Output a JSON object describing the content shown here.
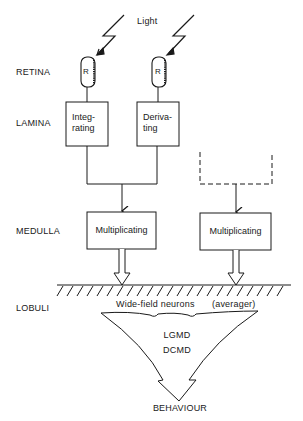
{
  "diagram": {
    "stimulus_label": "Light",
    "stages": [
      {
        "id": "retina",
        "label": "RETINA"
      },
      {
        "id": "lamina",
        "label": "LAMINA"
      },
      {
        "id": "medulla",
        "label": "MEDULLA"
      },
      {
        "id": "lobuli",
        "label": "LOBULI"
      }
    ],
    "receptors": [
      {
        "id": "receptor-left",
        "label": "R"
      },
      {
        "id": "receptor-right",
        "label": "R"
      }
    ],
    "lamina_boxes": [
      {
        "id": "integrating",
        "line1": "Integ-",
        "line2": "rating"
      },
      {
        "id": "derivating",
        "line1": "Deriva-",
        "line2": "ting"
      }
    ],
    "medulla_boxes": [
      {
        "id": "multiplicating-left",
        "label": "Multiplicating"
      },
      {
        "id": "multiplicating-right",
        "label": "Multiplicating"
      }
    ],
    "lobuli": {
      "wide_field_label": "Wide-field neurons",
      "averager_label": "(averager)",
      "neuron1": "LGMD",
      "neuron2": "DCMD"
    },
    "output_label": "BEHAVIOUR",
    "colors": {
      "ink": "#1a1a1a",
      "background": "#ffffff"
    }
  }
}
